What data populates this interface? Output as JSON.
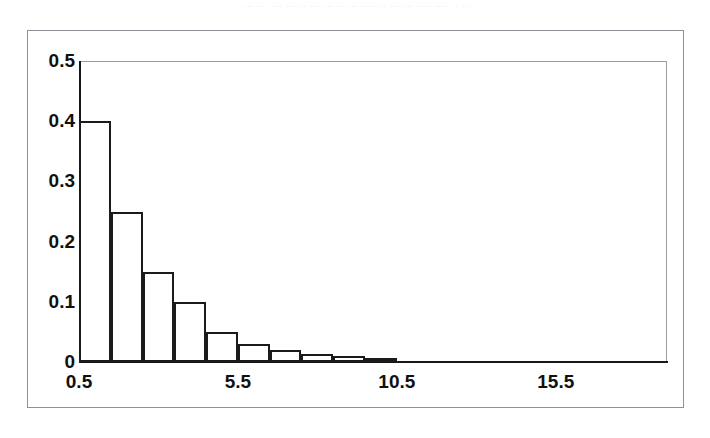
{
  "page": {
    "background_color": "#ffffff",
    "scan_artifact_text": "· ·· ·· ···· ··· ·· ···· ·· ··· ·· ···· ·· ··· ··· ···· ···· ·· ··"
  },
  "figure": {
    "frame_color": "#8d9096",
    "axis_color": "#171717",
    "plot_box_color": "#9a9da2",
    "bar_border_color": "#1b1b1b",
    "bar_fill_color": "#ffffff"
  },
  "chart_data": {
    "type": "bar",
    "title": "",
    "subtitle": "",
    "xlabel": "",
    "ylabel": "",
    "categories": [
      "0.5",
      "1.5",
      "2.5",
      "3.5",
      "4.5",
      "5.5",
      "6.5",
      "7.5",
      "8.5",
      "9.5"
    ],
    "values": [
      0.4,
      0.25,
      0.15,
      0.1,
      0.05,
      0.03,
      0.02,
      0.013,
      0.01,
      0.005
    ],
    "bar_left_edges": [
      0.5,
      1.5,
      2.5,
      3.5,
      4.5,
      5.5,
      6.5,
      7.5,
      8.5,
      9.5
    ],
    "bar_width": 1.0,
    "xlim": [
      0.5,
      19.0
    ],
    "ylim": [
      0,
      0.5
    ],
    "x_tick_values": [
      0.5,
      5.5,
      10.5,
      15.5
    ],
    "x_tick_labels": [
      "0.5",
      "5.5",
      "10.5",
      "15.5"
    ],
    "y_tick_values": [
      0,
      0.1,
      0.2,
      0.3,
      0.4,
      0.5
    ],
    "y_tick_labels": [
      "0",
      "0.1",
      "0.2",
      "0.3",
      "0.4",
      "0.5"
    ],
    "grid": false,
    "legend": false,
    "legend_position": "none",
    "annotations": []
  }
}
